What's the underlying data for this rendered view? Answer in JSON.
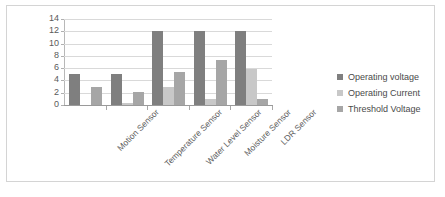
{
  "chart_data": {
    "type": "bar",
    "title": "",
    "xlabel": "",
    "ylabel": "",
    "ylim": [
      0,
      14
    ],
    "ytick_values": [
      14,
      12,
      10,
      8,
      6,
      4,
      2,
      0
    ],
    "ytick_labels": [
      "14",
      "12",
      "10",
      "8",
      "6",
      "4",
      "2",
      "0"
    ],
    "grid": true,
    "legend_position": "right",
    "categories": [
      "Motion Sensor",
      "Temperature Sensor",
      "Water Level Sensor",
      "Moisture Sensor",
      "LDR Sensor"
    ],
    "series": [
      {
        "name": "Operating voltage",
        "color": "#7f7f7f",
        "values": [
          5,
          5,
          12,
          12,
          12
        ]
      },
      {
        "name": "Operating Current",
        "color": "#c8c8c8",
        "values": [
          0,
          0.3,
          3,
          1,
          5.8
        ]
      },
      {
        "name": "Threshold Voltage",
        "color": "#a6a6a6",
        "values": [
          3,
          2.2,
          5.4,
          7.3,
          1
        ]
      }
    ]
  },
  "legend": {
    "items": [
      {
        "label": "Operating voltage",
        "color": "#7f7f7f"
      },
      {
        "label": "Operating Current",
        "color": "#c8c8c8"
      },
      {
        "label": "Threshold Voltage",
        "color": "#a6a6a6"
      }
    ]
  },
  "colors": {
    "frame_border": "#d4d4d4",
    "gridline": "#d9d9d9",
    "axis": "#9a9a9a",
    "text": "#5a5a5a",
    "background": "#ffffff"
  }
}
